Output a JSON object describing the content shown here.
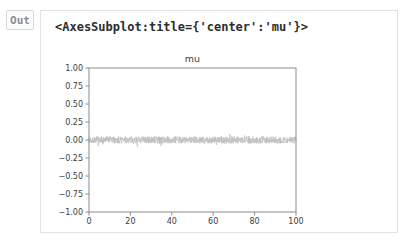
{
  "out_label": "Out",
  "output": {
    "repr_text": "<AxesSubplot:title={'center':'mu'}>"
  },
  "chart_data": {
    "type": "line",
    "title": "mu",
    "xlabel": "",
    "ylabel": "",
    "xlim": [
      0,
      100
    ],
    "ylim": [
      -1.0,
      1.0
    ],
    "xticks": [
      0,
      20,
      40,
      60,
      80,
      100
    ],
    "xtick_labels": [
      "0",
      "20",
      "40",
      "60",
      "80",
      "100"
    ],
    "yticks": [
      1.0,
      0.75,
      0.5,
      0.25,
      0.0,
      -0.25,
      -0.5,
      -0.75,
      -1.0
    ],
    "ytick_labels": [
      "1.00",
      "0.75",
      "0.50",
      "0.25",
      "0.00",
      "−0.25",
      "−0.50",
      "−0.75",
      "−1.00"
    ],
    "grid": false,
    "legend": null,
    "series": [
      {
        "name": "mu",
        "description": "dense random noise trace centered at 0, spanning x 0 to 100",
        "n_points": 1000,
        "mean": 0.0,
        "amplitude": 0.05,
        "spike_amplitude": 0.09,
        "color": "#bdbdbd"
      }
    ]
  },
  "colors": {
    "page_bg": "#ffffff",
    "box_border": "#e2e2e2",
    "out_chip_border": "#d8d8d8",
    "out_chip_text": "#8e8e8e",
    "repr_text": "#2d2d2d",
    "spine": "#8c8c8c",
    "tick_label": "#3d3d3d",
    "noise_line": "#bdbdbd"
  }
}
